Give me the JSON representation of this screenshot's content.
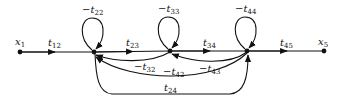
{
  "diagram": {
    "type": "signal-flow-graph",
    "nodes": [
      {
        "id": "x1",
        "label": "x",
        "sub": "1",
        "x": 20,
        "y": 52,
        "labeled": true
      },
      {
        "id": "x2",
        "label": "",
        "sub": "",
        "x": 94,
        "y": 52,
        "labeled": false
      },
      {
        "id": "x3",
        "label": "",
        "sub": "",
        "x": 170,
        "y": 51,
        "labeled": false
      },
      {
        "id": "x4",
        "label": "",
        "sub": "",
        "x": 247,
        "y": 51,
        "labeled": false
      },
      {
        "id": "x5",
        "label": "x",
        "sub": "5",
        "x": 324,
        "y": 51,
        "labeled": true
      }
    ],
    "edges": [
      {
        "from": "x1",
        "to": "x2",
        "label": "t",
        "sub": "12",
        "sign": ""
      },
      {
        "from": "x2",
        "to": "x3",
        "label": "t",
        "sub": "23",
        "sign": ""
      },
      {
        "from": "x3",
        "to": "x4",
        "label": "t",
        "sub": "34",
        "sign": ""
      },
      {
        "from": "x4",
        "to": "x5",
        "label": "t",
        "sub": "45",
        "sign": ""
      },
      {
        "from": "x2",
        "to": "x2",
        "label": "t",
        "sub": "22",
        "sign": "−"
      },
      {
        "from": "x3",
        "to": "x3",
        "label": "t",
        "sub": "33",
        "sign": "−"
      },
      {
        "from": "x4",
        "to": "x4",
        "label": "t",
        "sub": "44",
        "sign": "−"
      },
      {
        "from": "x3",
        "to": "x2",
        "label": "t",
        "sub": "32",
        "sign": "−"
      },
      {
        "from": "x4",
        "to": "x3",
        "label": "t",
        "sub": "43",
        "sign": "−"
      },
      {
        "from": "x4",
        "to": "x2",
        "label": "t",
        "sub": "42",
        "sign": "−"
      },
      {
        "from": "x2",
        "to": "x4",
        "label": "t",
        "sub": "24",
        "sign": ""
      }
    ],
    "colors": {
      "line": "#111111",
      "background": "#ffffff"
    }
  }
}
